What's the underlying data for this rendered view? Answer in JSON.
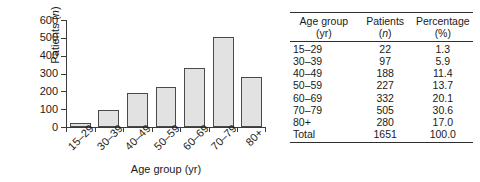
{
  "chart_data": {
    "type": "bar",
    "title": "",
    "xlabel": "Age group (yr)",
    "ylabel": "Patients (n)",
    "ylabel_parts": {
      "text": "Patients",
      "italic": "n"
    },
    "categories": [
      "15–29",
      "30–39",
      "40–49",
      "50–59",
      "60–69",
      "70–79",
      "80+"
    ],
    "values": [
      22,
      97,
      188,
      227,
      332,
      505,
      280
    ],
    "ylim": [
      0,
      600
    ],
    "yticks": [
      0,
      100,
      200,
      300,
      400,
      500,
      600
    ],
    "ytick_labels": [
      "0",
      "100",
      "200",
      "300",
      "400",
      "500",
      "600"
    ],
    "grid": false,
    "legend": null,
    "bar_fill_color": "#e2e2e2",
    "bar_edge_color": "#4a4a4a",
    "axis_color": "#3b3b3b"
  },
  "table": {
    "headers": [
      {
        "line1": "Age group",
        "line2": "(yr)"
      },
      {
        "line1": "Patients",
        "line2": "(n)",
        "line2_italic": "n"
      },
      {
        "line1": "Percentage",
        "line2": "(%)"
      }
    ],
    "rows": [
      {
        "group": "15–29",
        "patients": "22",
        "percentage": "1.3"
      },
      {
        "group": "30–39",
        "patients": "97",
        "percentage": "5.9"
      },
      {
        "group": "40–49",
        "patients": "188",
        "percentage": "11.4"
      },
      {
        "group": "50–59",
        "patients": "227",
        "percentage": "13.7"
      },
      {
        "group": "60–69",
        "patients": "332",
        "percentage": "20.1"
      },
      {
        "group": "70–79",
        "patients": "505",
        "percentage": "30.6"
      },
      {
        "group": "80+",
        "patients": "280",
        "percentage": "17.0"
      }
    ],
    "total": {
      "group": "Total",
      "patients": "1651",
      "percentage": "100.0"
    }
  }
}
